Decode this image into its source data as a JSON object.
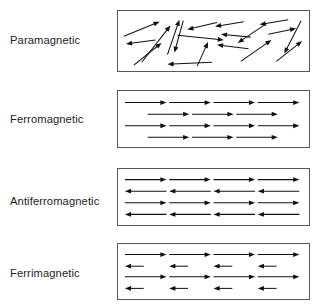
{
  "figure": {
    "background_color": "#ffffff",
    "arrow_color": "#111111",
    "box_border_color": "#595959"
  },
  "rows": [
    {
      "label": "Paramagnetic",
      "label_name": "label-paramagnetic",
      "box_name": "box-paramagnetic",
      "description": "randomly oriented magnetic moments",
      "box": {
        "x": 117,
        "y": 10,
        "width": 193,
        "height": 62
      },
      "label_y": 35,
      "arrow_layout": "random",
      "arrows": [
        {
          "x1": 6,
          "y1": 26,
          "x2": 42,
          "y2": 11
        },
        {
          "x1": 38,
          "y1": 30,
          "x2": 8,
          "y2": 34
        },
        {
          "x1": 24,
          "y1": 53,
          "x2": 53,
          "y2": 15
        },
        {
          "x1": 16,
          "y1": 56,
          "x2": 44,
          "y2": 33
        },
        {
          "x1": 50,
          "y1": 45,
          "x2": 62,
          "y2": 9
        },
        {
          "x1": 66,
          "y1": 10,
          "x2": 57,
          "y2": 43
        },
        {
          "x1": 95,
          "y1": 53,
          "x2": 50,
          "y2": 55
        },
        {
          "x1": 100,
          "y1": 12,
          "x2": 70,
          "y2": 19
        },
        {
          "x1": 60,
          "y1": 25,
          "x2": 107,
          "y2": 30
        },
        {
          "x1": 80,
          "y1": 57,
          "x2": 91,
          "y2": 32
        },
        {
          "x1": 127,
          "y1": 11,
          "x2": 98,
          "y2": 16
        },
        {
          "x1": 134,
          "y1": 27,
          "x2": 104,
          "y2": 24
        },
        {
          "x1": 132,
          "y1": 39,
          "x2": 100,
          "y2": 35
        },
        {
          "x1": 150,
          "y1": 13,
          "x2": 121,
          "y2": 33
        },
        {
          "x1": 124,
          "y1": 52,
          "x2": 155,
          "y2": 30
        },
        {
          "x1": 172,
          "y1": 9,
          "x2": 143,
          "y2": 14
        },
        {
          "x1": 160,
          "y1": 52,
          "x2": 186,
          "y2": 31
        },
        {
          "x1": 185,
          "y1": 10,
          "x2": 168,
          "y2": 44
        },
        {
          "x1": 152,
          "y1": 24,
          "x2": 180,
          "y2": 18
        }
      ]
    },
    {
      "label": "Ferromagnetic",
      "label_name": "label-ferromagnetic",
      "box_name": "box-ferromagnetic",
      "description": "parallel aligned moments, all pointing right",
      "box": {
        "x": 117,
        "y": 90,
        "width": 193,
        "height": 58
      },
      "label_y": 114,
      "arrow_layout": "aligned-staggered",
      "arrow_rows": [
        {
          "y": 12,
          "indent": 0,
          "count": 4,
          "direction": "right",
          "length": 42
        },
        {
          "y": 24,
          "indent": 23,
          "count": 3,
          "direction": "right",
          "length": 42
        },
        {
          "y": 36,
          "indent": 0,
          "count": 4,
          "direction": "right",
          "length": 42
        },
        {
          "y": 48,
          "indent": 23,
          "count": 3,
          "direction": "right",
          "length": 42
        }
      ]
    },
    {
      "label": "Antiferromagnetic",
      "label_name": "label-antiferromagnetic",
      "box_name": "box-antiferromagnetic",
      "description": "antiparallel moments of equal magnitude",
      "box": {
        "x": 117,
        "y": 168,
        "width": 193,
        "height": 58
      },
      "label_y": 196,
      "arrow_layout": "alternating-equal",
      "arrow_rows": [
        {
          "y": 11,
          "indent": 0,
          "count": 4,
          "direction": "right",
          "length": 42
        },
        {
          "y": 23,
          "indent": 0,
          "count": 4,
          "direction": "left",
          "length": 42
        },
        {
          "y": 35,
          "indent": 0,
          "count": 4,
          "direction": "right",
          "length": 42
        },
        {
          "y": 47,
          "indent": 0,
          "count": 4,
          "direction": "left",
          "length": 42
        }
      ]
    },
    {
      "label": "Ferrimagnetic",
      "label_name": "label-ferrimagnetic",
      "box_name": "box-ferrimagnetic",
      "description": "antiparallel moments of unequal magnitude",
      "box": {
        "x": 117,
        "y": 243,
        "width": 193,
        "height": 57
      },
      "label_y": 268,
      "arrow_layout": "alternating-unequal",
      "arrow_rows": [
        {
          "y": 11,
          "indent": 0,
          "count": 4,
          "direction": "right",
          "length": 42
        },
        {
          "y": 23,
          "indent": 0,
          "count": 4,
          "direction": "left",
          "length": 19
        },
        {
          "y": 34,
          "indent": 0,
          "count": 4,
          "direction": "right",
          "length": 42
        },
        {
          "y": 46,
          "indent": 0,
          "count": 4,
          "direction": "left",
          "length": 19
        }
      ]
    }
  ]
}
